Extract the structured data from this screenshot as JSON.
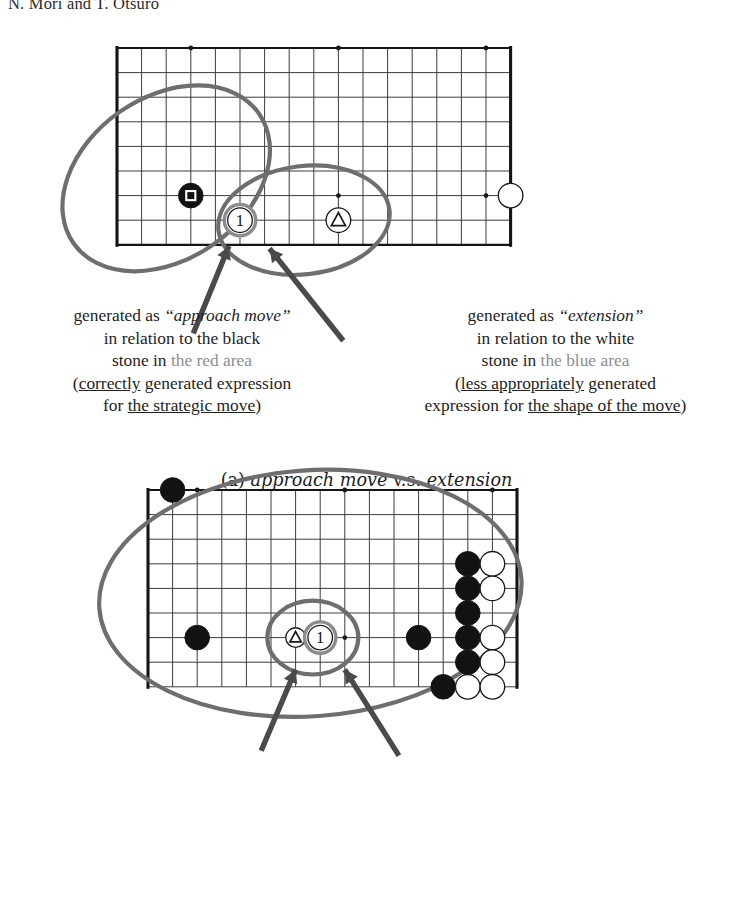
{
  "page": {
    "running_head": "N. Mori and T. Otsuro",
    "background": "#ffffff",
    "ink": "#1b1b1b",
    "annotation_gray": "#6e6e70",
    "dim_text": "#8e8e90"
  },
  "figures": [
    {
      "id": "a",
      "subcaption": {
        "tag": "(a)",
        "text_italic_1": "approach move",
        "text_roman": "v.s.",
        "text_italic_2": "extension"
      },
      "board": {
        "cols": 17,
        "rows": 9,
        "cell": 24.6,
        "star_points": [
          [
            3,
            0
          ],
          [
            9,
            0
          ],
          [
            15,
            0
          ],
          [
            3,
            6
          ],
          [
            9,
            6
          ],
          [
            15,
            6
          ]
        ],
        "edges": {
          "left": true,
          "right": true,
          "top": true,
          "bottom": true
        },
        "stones": [
          {
            "color": "black",
            "col": 3,
            "row": 6,
            "mark": "square"
          },
          {
            "color": "white",
            "col": 16,
            "row": 6,
            "mark": "none"
          },
          {
            "color": "white",
            "col": 9,
            "row": 7,
            "mark": "triangle"
          },
          {
            "color": "white",
            "col": 5,
            "row": 7,
            "mark": "number",
            "label": "1",
            "highlight": true
          }
        ],
        "ellipses": [
          {
            "name": "red-area",
            "cx": 2.0,
            "cy": 5.3,
            "rx": 4.6,
            "ry": 3.3,
            "rot": -35
          },
          {
            "name": "blue-area",
            "cx": 7.6,
            "cy": 7.0,
            "rx": 3.5,
            "ry": 2.2,
            "rot": -7
          }
        ],
        "arrows": [
          {
            "from": [
              3.1,
              11.6
            ],
            "to": [
              4.55,
              8.05
            ]
          },
          {
            "from": [
              9.2,
              11.9
            ],
            "to": [
              6.2,
              8.15
            ]
          }
        ]
      },
      "captions": {
        "left": {
          "lines": [
            [
              {
                "t": "generated as ",
                "s": "plain"
              },
              {
                "t": "“approach move”",
                "s": "italic"
              }
            ],
            [
              {
                "t": "in relation to the black",
                "s": "plain"
              }
            ],
            [
              {
                "t": "stone in ",
                "s": "plain"
              },
              {
                "t": "the red area",
                "s": "dim"
              }
            ],
            [
              {
                "t": "(",
                "s": "plain"
              },
              {
                "t": "correctly",
                "s": "underline"
              },
              {
                "t": " generated expression",
                "s": "plain"
              }
            ],
            [
              {
                "t": "for ",
                "s": "plain"
              },
              {
                "t": "the strategic move",
                "s": "underline"
              },
              {
                "t": ")",
                "s": "plain"
              }
            ]
          ]
        },
        "right": {
          "lines": [
            [
              {
                "t": "generated as ",
                "s": "plain"
              },
              {
                "t": "“extension”",
                "s": "italic"
              }
            ],
            [
              {
                "t": "in relation to the white",
                "s": "plain"
              }
            ],
            [
              {
                "t": "stone in ",
                "s": "plain"
              },
              {
                "t": "the blue area",
                "s": "dim"
              }
            ],
            [
              {
                "t": "(",
                "s": "plain"
              },
              {
                "t": "less appropriately",
                "s": "underline"
              },
              {
                "t": " generated",
                "s": "plain"
              }
            ],
            [
              {
                "t": "expression for ",
                "s": "plain"
              },
              {
                "t": "the shape of the move",
                "s": "underline"
              },
              {
                "t": ")",
                "s": "plain"
              }
            ]
          ]
        }
      }
    },
    {
      "id": "b",
      "subcaption": null,
      "board": {
        "cols": 16,
        "rows": 9,
        "cell": 24.6,
        "star_points": [
          [
            2,
            0
          ],
          [
            8,
            0
          ],
          [
            14,
            0
          ],
          [
            2,
            6
          ],
          [
            8,
            6
          ],
          [
            14,
            6
          ]
        ],
        "edges": {
          "left": true,
          "right": true,
          "top": true,
          "bottom": false
        },
        "stones": [
          {
            "color": "black",
            "col": 1,
            "row": 0,
            "mark": "none"
          },
          {
            "color": "black",
            "col": 2,
            "row": 6,
            "mark": "none"
          },
          {
            "color": "black",
            "col": 11,
            "row": 6,
            "mark": "none"
          },
          {
            "color": "black",
            "col": 13,
            "row": 3,
            "mark": "none"
          },
          {
            "color": "black",
            "col": 13,
            "row": 4,
            "mark": "none"
          },
          {
            "color": "black",
            "col": 13,
            "row": 5,
            "mark": "none"
          },
          {
            "color": "black",
            "col": 13,
            "row": 6,
            "mark": "none"
          },
          {
            "color": "black",
            "col": 13,
            "row": 7,
            "mark": "none"
          },
          {
            "color": "black",
            "col": 12,
            "row": 8,
            "mark": "none"
          },
          {
            "color": "white",
            "col": 14,
            "row": 3,
            "mark": "none"
          },
          {
            "color": "white",
            "col": 14,
            "row": 4,
            "mark": "none"
          },
          {
            "color": "white",
            "col": 14,
            "row": 6,
            "mark": "none"
          },
          {
            "color": "white",
            "col": 14,
            "row": 7,
            "mark": "none"
          },
          {
            "color": "white",
            "col": 13,
            "row": 8,
            "mark": "none"
          },
          {
            "color": "white",
            "col": 14,
            "row": 8,
            "mark": "none"
          },
          {
            "color": "white",
            "col": 6,
            "row": 6,
            "mark": "triangle",
            "small": true
          },
          {
            "color": "white",
            "col": 7,
            "row": 6,
            "mark": "number",
            "label": "1",
            "highlight": true
          }
        ],
        "ellipses": [
          {
            "name": "red-area",
            "cx": 6.6,
            "cy": 4.2,
            "rx": 8.6,
            "ry": 5.0,
            "rot": -4
          },
          {
            "name": "blue-area",
            "cx": 6.7,
            "cy": 6.0,
            "rx": 1.85,
            "ry": 1.5,
            "rot": 0
          }
        ],
        "arrows": [
          {
            "from": [
              4.6,
              10.6
            ],
            "to": [
              6.0,
              7.3
            ]
          },
          {
            "from": [
              10.2,
              10.8
            ],
            "to": [
              8.0,
              7.3
            ]
          }
        ]
      },
      "captions": {
        "left": {
          "lines": [
            [
              {
                "t": "generated as ",
                "s": "plain"
              },
              {
                "t": "“invasion”",
                "s": "italic"
              }
            ],
            [
              {
                "t": "in relation to the black",
                "s": "plain"
              }
            ],
            [
              {
                "t": "stones in ",
                "s": "plain"
              },
              {
                "t": "the red area",
                "s": "dim"
              }
            ],
            [
              {
                "t": "(",
                "s": "plain"
              },
              {
                "t": "correctly",
                "s": "underline"
              },
              {
                "t": " generated expression",
                "s": "plain"
              }
            ],
            [
              {
                "t": "for the strategic move)",
                "s": "plain"
              }
            ]
          ]
        },
        "right": {
          "lines": [
            [
              {
                "t": "generated as ",
                "s": "plain"
              },
              {
                "t": "“attachment”",
                "s": "italic"
              }
            ],
            [
              {
                "t": "in relation to the white",
                "s": "plain"
              }
            ],
            [
              {
                "t": "stone in ",
                "s": "plain"
              },
              {
                "t": "the blue area",
                "s": "dim"
              }
            ],
            [
              {
                "t": "(",
                "s": "plain"
              },
              {
                "t": "less appropriately",
                "s": "underline"
              },
              {
                "t": " generated",
                "s": "plain"
              }
            ],
            [
              {
                "t": "expression for the shape of the move)",
                "s": "plain"
              }
            ]
          ]
        }
      }
    }
  ]
}
